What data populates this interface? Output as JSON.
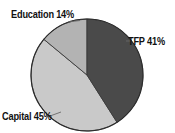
{
  "chart_data": {
    "type": "pie",
    "title": "",
    "subtitle": "",
    "xlabel": "",
    "ylabel": "",
    "grid": false,
    "legend_position": "none",
    "label_style": "outside-callout",
    "start_angle_deg": 0,
    "direction": "clockwise",
    "categories": [
      "TFP",
      "Capital",
      "Education"
    ],
    "values": [
      41,
      45,
      14
    ],
    "units": "percent",
    "total": 100,
    "slices": [
      {
        "name": "TFP",
        "value": 41,
        "label": "TFP 41%",
        "color": "#4a4a4a",
        "percent_text": "41%",
        "position": "right"
      },
      {
        "name": "Capital",
        "value": 45,
        "label": "Capital 45%",
        "color": "#c9c9c9",
        "percent_text": "45%",
        "position": "bottom-left"
      },
      {
        "name": "Education",
        "value": 14,
        "label": "Education 14%",
        "color": "#b3b3b3",
        "percent_text": "14%",
        "position": "top-left"
      }
    ],
    "annotations": [
      {
        "text": "Education 14%",
        "anchor": "top-left"
      },
      {
        "text": "TFP 41%",
        "anchor": "right"
      },
      {
        "text": "Capital 45%",
        "anchor": "bottom-left"
      }
    ],
    "colors": {
      "background": "#ffffff",
      "outline": "#2b2b2b",
      "text": "#111111",
      "slice_tfp": "#4a4a4a",
      "slice_capital": "#c9c9c9",
      "slice_education": "#b3b3b3"
    },
    "geometry": {
      "center_x": 87,
      "center_y": 75,
      "radius": 56
    },
    "leader_lines": [
      {
        "for": "Education",
        "from_x": 78,
        "from_y": 21,
        "to_x": 66,
        "to_y": 22
      },
      {
        "for": "TFP",
        "from_x": 130,
        "from_y": 41,
        "to_x": 126,
        "to_y": 41
      },
      {
        "for": "Capital",
        "from_x": 50,
        "from_y": 116,
        "to_x": 62,
        "to_y": 113
      }
    ]
  }
}
